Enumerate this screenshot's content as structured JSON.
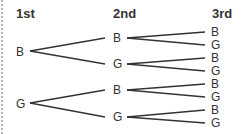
{
  "headers": {
    "first": "1st",
    "second": "2nd",
    "third": "3rd"
  },
  "level1": [
    {
      "label": "B"
    },
    {
      "label": "G"
    }
  ],
  "level2": [
    {
      "label": "B"
    },
    {
      "label": "G"
    },
    {
      "label": "B"
    },
    {
      "label": "G"
    }
  ],
  "level3": [
    {
      "label": "B"
    },
    {
      "label": "G"
    },
    {
      "label": "B"
    },
    {
      "label": "G"
    },
    {
      "label": "B"
    },
    {
      "label": "G"
    },
    {
      "label": "B"
    },
    {
      "label": "G"
    }
  ],
  "colors": {
    "line": "#333333",
    "text": "#333333",
    "border": "#b5b5b5"
  }
}
